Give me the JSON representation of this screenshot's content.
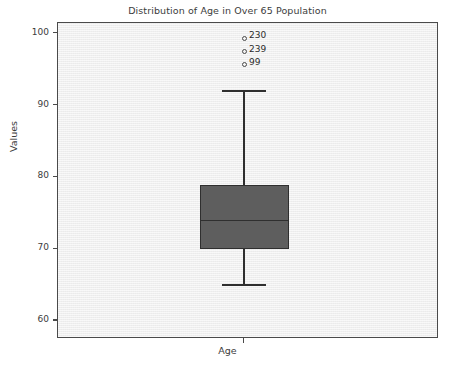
{
  "chart_data": {
    "type": "box",
    "title": "Distribution of Age in Over 65 Population",
    "xlabel": "Age",
    "ylabel": "Values",
    "categories": [
      "Age"
    ],
    "ylim": [
      57.5,
      101.5
    ],
    "yticks": [
      60,
      70,
      80,
      90,
      100
    ],
    "ytick_labels": [
      "60",
      "70",
      "80",
      "90",
      "100"
    ],
    "grid": false,
    "legend": null,
    "boxes": [
      {
        "label": "Age",
        "whisker_low": 65,
        "q1": 70,
        "median": 74,
        "q3": 79,
        "whisker_high": 92,
        "outliers": [
          {
            "value": 99.4,
            "label": "230"
          },
          {
            "value": 97.5,
            "label": "239"
          },
          {
            "value": 95.7,
            "label": "99"
          }
        ]
      }
    ],
    "colors": {
      "box_fill": "#5e5e5e",
      "box_edge": "#2f2f2f",
      "median": "#2f2f2f",
      "whisker": "#2f2f2f",
      "panel_bg": "#f2f2f2",
      "axis": "#4a4a4a",
      "text": "#3c3c3c"
    }
  }
}
